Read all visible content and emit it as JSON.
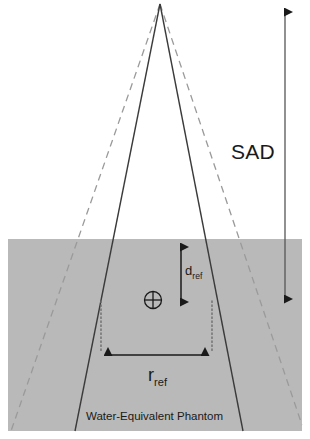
{
  "figure": {
    "labels": {
      "sad": "SAD",
      "d_ref_base": "d",
      "d_ref_sub": "ref",
      "r_ref_base": "r",
      "r_ref_sub": "ref",
      "phantom": "Water-Equivalent Phantom"
    },
    "colors": {
      "phantom_fill": "#b9b9b9",
      "line": "#3b3b3b",
      "dashed_line": "#9a9a9a",
      "dotted_line": "#6e6e6e",
      "arrow": "#1a1a1a",
      "text": "#1a1a1a",
      "background": "#ffffff"
    },
    "geometry": {
      "canvas_width": 310,
      "canvas_height": 439,
      "source_apex": {
        "x": 160,
        "y": 4
      },
      "phantom": {
        "x": 8,
        "y": 239,
        "width": 294,
        "height": 192
      },
      "solid_beam": {
        "left_bottom": {
          "x": 75,
          "y": 431
        },
        "right_bottom": {
          "x": 243,
          "y": 431
        }
      },
      "dashed_beam": {
        "left_bottom": {
          "x": 11,
          "y": 431
        },
        "right_bottom": {
          "x": 302,
          "y": 425
        }
      },
      "sad_arrow": {
        "x": 285,
        "y_top": 5,
        "y_bottom": 306
      },
      "d_ref_arrow": {
        "x": 181,
        "y_top": 240,
        "y_bottom": 309
      },
      "r_ref_arrow": {
        "y": 355,
        "x_left": 101,
        "x_right": 212
      },
      "dotted_verticals": {
        "left_x": 101,
        "right_x": 212,
        "y_top": 301,
        "y_bottom": 352
      },
      "reference_point": {
        "x": 153,
        "y": 300,
        "radius": 9
      }
    },
    "icons": {
      "reference_point": "crosshair-circle-icon",
      "sad_arrow": "double-headed-vertical-arrow-icon",
      "d_ref_arrow": "double-headed-vertical-arrow-icon",
      "r_ref_arrow": "double-headed-horizontal-arrow-icon"
    }
  }
}
